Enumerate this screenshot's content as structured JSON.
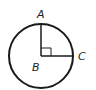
{
  "diagram": {
    "type": "circle-geometry",
    "labels": {
      "top_point": "A",
      "center_point": "B",
      "right_point": "C"
    },
    "shapes": {
      "circle": {
        "cx": 41,
        "cy": 56,
        "r": 32
      },
      "radius_vertical": {
        "from": "B",
        "to": "A"
      },
      "radius_horizontal": {
        "from": "B",
        "to": "C"
      },
      "right_angle_marker": {
        "at": "B"
      }
    },
    "colors": {
      "stroke": "#1a1a1a",
      "background": "#ffffff"
    }
  }
}
